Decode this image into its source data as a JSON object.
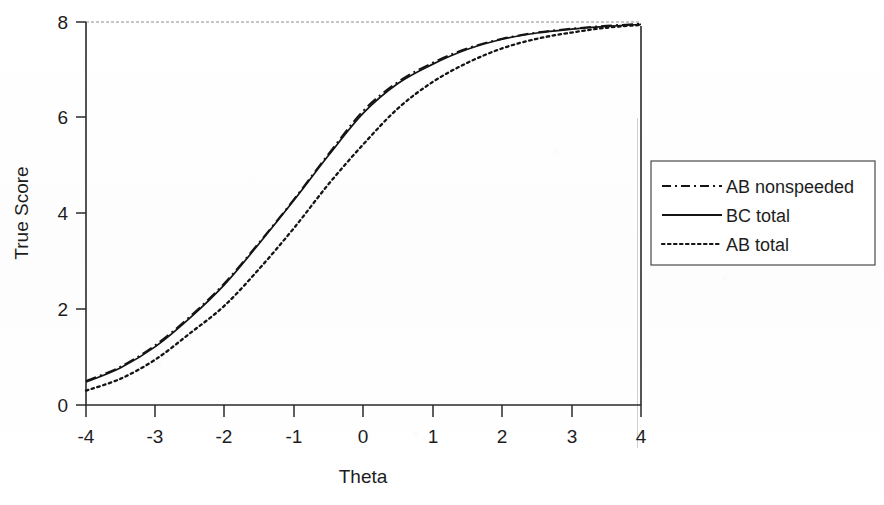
{
  "chart_data": {
    "type": "line",
    "title": "",
    "xlabel": "Theta",
    "ylabel": "True Score",
    "xlim": [
      -4,
      4
    ],
    "ylim": [
      0,
      8
    ],
    "xticks": [
      "-4",
      "-3",
      "-2",
      "-1",
      "0",
      "1",
      "2",
      "3",
      "4"
    ],
    "xtick_values": [
      -4,
      -3,
      -2,
      -1,
      0,
      1,
      2,
      3,
      4
    ],
    "yticks": [
      "0",
      "2",
      "4",
      "6",
      "8"
    ],
    "ytick_values": [
      0,
      2,
      4,
      6,
      8
    ],
    "grid": false,
    "legend_position": "right-outside",
    "x": [
      -4,
      -3.5,
      -3,
      -2.5,
      -2,
      -1.5,
      -1,
      -0.5,
      0,
      0.5,
      1,
      1.5,
      2,
      2.5,
      3,
      3.5,
      4
    ],
    "series": [
      {
        "name": "AB nonspeeded",
        "style": "dash-dot",
        "color": "#141414",
        "values": [
          0.5,
          0.8,
          1.25,
          1.85,
          2.55,
          3.4,
          4.3,
          5.25,
          6.15,
          6.75,
          7.15,
          7.45,
          7.65,
          7.78,
          7.86,
          7.92,
          7.96
        ]
      },
      {
        "name": "BC total",
        "style": "solid",
        "color": "#141414",
        "values": [
          0.48,
          0.78,
          1.22,
          1.82,
          2.52,
          3.38,
          4.28,
          5.22,
          6.1,
          6.72,
          7.12,
          7.43,
          7.64,
          7.77,
          7.85,
          7.91,
          7.95
        ]
      },
      {
        "name": "AB total",
        "style": "dotted",
        "color": "#141414",
        "values": [
          0.3,
          0.55,
          0.95,
          1.5,
          2.08,
          2.85,
          3.7,
          4.62,
          5.45,
          6.2,
          6.75,
          7.15,
          7.45,
          7.65,
          7.78,
          7.88,
          7.94
        ]
      }
    ]
  },
  "axes": {
    "x_title": "Theta",
    "y_title": "True Score"
  },
  "legend": {
    "items": [
      {
        "label": "AB nonspeeded",
        "style": "dash-dot"
      },
      {
        "label": "BC total",
        "style": "solid"
      },
      {
        "label": "AB total",
        "style": "dotted"
      }
    ]
  }
}
